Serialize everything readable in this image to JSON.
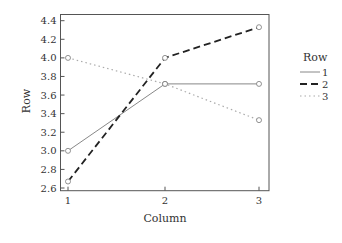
{
  "chart_data": {
    "type": "line",
    "title": "",
    "xlabel": "Column",
    "ylabel": "Row",
    "x": [
      1,
      2,
      3
    ],
    "categories": [
      "1",
      "2",
      "3"
    ],
    "series": [
      {
        "name": "1",
        "values": [
          3.0,
          3.72,
          3.72
        ],
        "style": "solid",
        "color": "#888888"
      },
      {
        "name": "2",
        "values": [
          2.67,
          4.0,
          4.33
        ],
        "style": "dashed",
        "color": "#222222"
      },
      {
        "name": "3",
        "values": [
          4.0,
          3.72,
          3.33
        ],
        "style": "dotted",
        "color": "#aaaaaa"
      }
    ],
    "ylim": [
      2.57,
      4.47
    ],
    "yticks": [
      "2.6",
      "2.8",
      "3.0",
      "3.2",
      "3.4",
      "3.6",
      "3.8",
      "4.0",
      "4.2",
      "4.4"
    ],
    "xticks": [
      "1",
      "2",
      "3"
    ],
    "grid": false,
    "legend": {
      "title": "Row",
      "position": "right",
      "entries": [
        "1",
        "2",
        "3"
      ]
    },
    "markers": "open-circle"
  }
}
